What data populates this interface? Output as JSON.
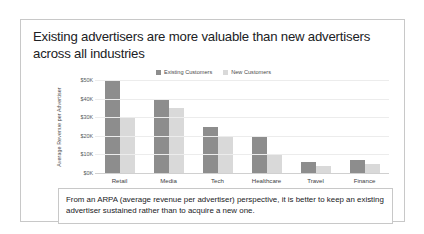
{
  "slide": {
    "title": "Existing advertisers are more valuable than new advertisers across all industries",
    "footnote": "From an ARPA (average revenue per advertiser) perspective, it is better to keep an existing advertiser sustained rather than to acquire a new one."
  },
  "colors": {
    "existing_customers": "#8d8d8d",
    "new_customers": "#d9d9d9",
    "frame_border": "#c8c8c8",
    "gridline": "#ececec",
    "text": "#202124"
  },
  "chart_data": {
    "type": "bar",
    "title": "",
    "xlabel": "",
    "ylabel": "Average Revenue per Advertiser",
    "categories": [
      "Retail",
      "Media",
      "Tech",
      "Healthcare",
      "Travel",
      "Finance"
    ],
    "series": [
      {
        "name": "Existing Customers",
        "values": [
          50,
          40,
          25,
          20,
          6,
          7
        ]
      },
      {
        "name": "New Customers",
        "values": [
          29.5,
          35,
          20,
          10,
          4,
          5
        ]
      }
    ],
    "units": "$K",
    "ylim": [
      0,
      50
    ],
    "ytick_values": [
      0,
      10,
      20,
      30,
      40,
      50
    ],
    "ytick_labels": [
      "$0K",
      "$10K",
      "$20K",
      "$30K",
      "$40K",
      "$50K"
    ],
    "grid": true,
    "legend_position": "top-center",
    "legend_entries": [
      "Existing Customers",
      "New Customers"
    ]
  }
}
